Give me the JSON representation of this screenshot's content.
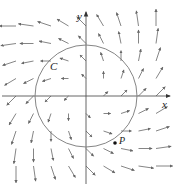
{
  "diagram": {
    "type": "vector-field",
    "field_formula": "F(x,y) = (x - y, x + y)",
    "axes": {
      "x_label": "x",
      "y_label": "y"
    },
    "curve": {
      "label": "C",
      "shape": "circle",
      "center": [
        0,
        0
      ]
    },
    "point": {
      "label": "P"
    },
    "colors": {
      "axis": "#555555",
      "arrow": "#666666",
      "curve": "#777777",
      "text": "#222222"
    },
    "grid": {
      "columns": [
        -4,
        -3,
        -2,
        -1,
        0,
        1,
        2,
        3,
        4
      ],
      "rows": [
        4,
        3,
        2,
        1,
        0,
        -1,
        -2,
        -3,
        -4
      ]
    }
  }
}
